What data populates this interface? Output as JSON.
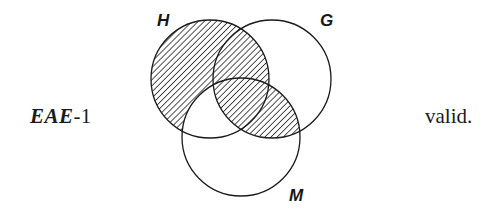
{
  "figure": {
    "type": "venn-diagram",
    "circle_count": 3,
    "left_label": {
      "bold_italic_part": "EAE",
      "plain_part": "-1",
      "full_text": "EAE-1"
    },
    "right_label": {
      "text": "valid."
    },
    "circles": [
      {
        "id": "H",
        "label": "H",
        "cx": 210,
        "cy": 79,
        "r": 59,
        "label_x": 157,
        "label_y": 11
      },
      {
        "id": "G",
        "label": "G",
        "cx": 272,
        "cy": 79,
        "r": 59,
        "label_x": 320,
        "label_y": 11
      },
      {
        "id": "M",
        "label": "M",
        "cx": 241,
        "cy": 137,
        "r": 59,
        "label_x": 289,
        "label_y": 186
      }
    ],
    "shading": {
      "style": "diagonal-hatch",
      "hatch_angle_deg": 45,
      "hatch_spacing_px": 3,
      "shaded_regions": [
        "H-only",
        "H-and-G-not-M",
        "G-and-M"
      ],
      "unshaded_regions": [
        "G-only",
        "M-only",
        "H-and-M-not-G",
        "outside"
      ]
    },
    "stroke_color": "#1a1a1a",
    "stroke_width": 1.2,
    "background_color": "#ffffff",
    "ink_color": "#1a1a1a"
  }
}
